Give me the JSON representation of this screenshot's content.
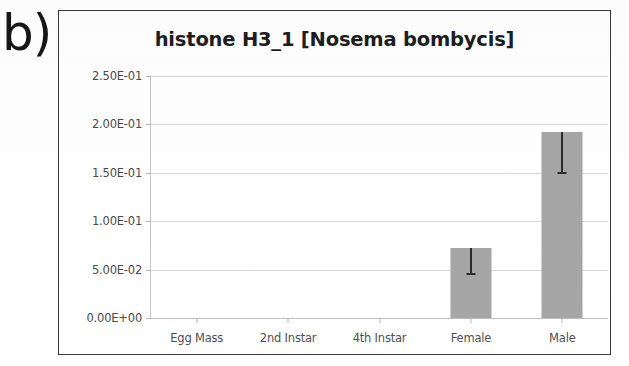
{
  "figure": {
    "panel_label": "b)"
  },
  "chart_data": {
    "type": "bar",
    "title": "histone H3_1 [Nosema bombycis]",
    "xlabel": "",
    "ylabel": "",
    "categories": [
      "Egg Mass",
      "2nd Instar",
      "4th Instar",
      "Female",
      "Male"
    ],
    "values": [
      0.0,
      0.0,
      0.0,
      0.072,
      0.192
    ],
    "errors_low": [
      0.0,
      0.0,
      0.0,
      0.0275,
      0.0435
    ],
    "errors_high": [
      0.0,
      0.0,
      0.0,
      0.0,
      0.0
    ],
    "ylim": [
      0.0,
      0.25
    ],
    "ytick_values": [
      0.25,
      0.2,
      0.15,
      0.1,
      0.05,
      0.0
    ],
    "ytick_labels": [
      "2.50E-01",
      "2.00E-01",
      "1.50E-01",
      "1.00E-01",
      "5.00E-02",
      "0.00E+00"
    ],
    "grid": true,
    "legend": false,
    "bar_color": "#a6a6a6",
    "error_color": "#2c2c2c",
    "grid_color": "#d9d9d9"
  }
}
